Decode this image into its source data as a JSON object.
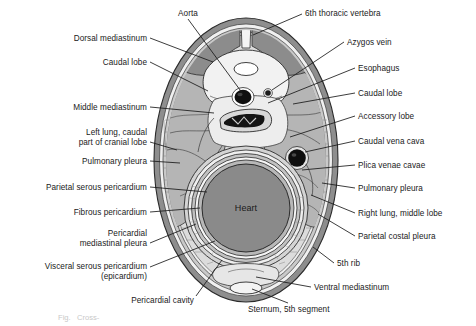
{
  "figure": {
    "center_label": "Heart",
    "faint_caption": "Fig.   Cross-"
  },
  "colors": {
    "outer_wall_dark": "#8e8e8e",
    "wall_light": "#f2f2f2",
    "rib_band": "#c6c6c6",
    "lung": "#b6b6b6",
    "lung_light": "#c8c8c8",
    "mediastinum_light": "#e4e4e4",
    "heart": "#8a8a8a",
    "vertebra_muscle": "#8e8e8e",
    "vessel_black": "#111111",
    "line": "#1a1a1a",
    "text": "#1a1a1a"
  },
  "labels_left": [
    {
      "id": "dorsal-mediastinum",
      "text": "Dorsal mediastinum",
      "x": 14,
      "y": 34,
      "w": 133,
      "align": "right",
      "line": [
        [
          150,
          38
        ],
        [
          213,
          62
        ]
      ]
    },
    {
      "id": "caudal-lobe-left",
      "text": "Caudal lobe",
      "x": 14,
      "y": 58,
      "w": 133,
      "align": "right",
      "line": [
        [
          150,
          62
        ],
        [
          208,
          91
        ]
      ]
    },
    {
      "id": "middle-mediastinum",
      "text": "Middle mediastinum",
      "x": 4,
      "y": 103,
      "w": 143,
      "align": "right",
      "line": [
        [
          150,
          107
        ],
        [
          214,
          113
        ]
      ]
    },
    {
      "id": "left-lung-caudal-cranial",
      "text": "Left lung, caudal\npart of cranial lobe",
      "x": 4,
      "y": 128,
      "w": 143,
      "align": "right",
      "line": [
        [
          150,
          142
        ],
        [
          177,
          150
        ]
      ]
    },
    {
      "id": "pulmonary-pleura-left",
      "text": "Pulmonary pleura",
      "x": 4,
      "y": 157,
      "w": 143,
      "align": "right",
      "line": [
        [
          150,
          161
        ],
        [
          180,
          163
        ]
      ]
    },
    {
      "id": "parietal-serous-pericardium",
      "text": "Parietal serous pericardium",
      "x": 2,
      "y": 183,
      "w": 145,
      "align": "right",
      "line": [
        [
          150,
          187
        ],
        [
          207,
          192
        ]
      ]
    },
    {
      "id": "fibrous-pericardium",
      "text": "Fibrous pericardium",
      "x": 6,
      "y": 208,
      "w": 141,
      "align": "right",
      "line": [
        [
          150,
          212
        ],
        [
          200,
          208
        ]
      ]
    },
    {
      "id": "pericardial-mediastinal-pleura",
      "text": "Pericardial\nmediastinal pleura",
      "x": 6,
      "y": 229,
      "w": 141,
      "align": "right",
      "line": [
        [
          150,
          243
        ],
        [
          196,
          224
        ]
      ]
    },
    {
      "id": "visceral-serous-pericardium",
      "text": "Visceral serous pericardium\n(epicardium)",
      "x": 2,
      "y": 262,
      "w": 145,
      "align": "right",
      "line": [
        [
          150,
          267
        ],
        [
          215,
          241
        ]
      ]
    },
    {
      "id": "pericardial-cavity",
      "text": "Pericardial cavity",
      "x": 104,
      "y": 296,
      "w": 90,
      "align": "right",
      "line": [
        [
          196,
          296
        ],
        [
          222,
          260
        ]
      ]
    }
  ],
  "labels_right": [
    {
      "id": "6th-thoracic-vertebra",
      "text": "6th thoracic vertebra",
      "x": 305,
      "y": 9,
      "w": 160,
      "align": "left",
      "line": [
        [
          302,
          14
        ],
        [
          253,
          35
        ]
      ]
    },
    {
      "id": "azygos-vein",
      "text": "Azygos vein",
      "x": 347,
      "y": 38,
      "w": 125,
      "align": "left",
      "line": [
        [
          344,
          42
        ],
        [
          272,
          90
        ]
      ]
    },
    {
      "id": "esophagus",
      "text": "Esophagus",
      "x": 358,
      "y": 64,
      "w": 114,
      "align": "left",
      "line": [
        [
          355,
          68
        ],
        [
          268,
          103
        ]
      ]
    },
    {
      "id": "caudal-lobe-right",
      "text": "Caudal lobe",
      "x": 358,
      "y": 89,
      "w": 114,
      "align": "left",
      "line": [
        [
          355,
          93
        ],
        [
          293,
          104
        ]
      ]
    },
    {
      "id": "accessory-lobe",
      "text": "Accessory lobe",
      "x": 358,
      "y": 112,
      "w": 114,
      "align": "left",
      "line": [
        [
          355,
          116
        ],
        [
          290,
          137
        ]
      ]
    },
    {
      "id": "caudal-vena-cava",
      "text": "Caudal vena cava",
      "x": 358,
      "y": 137,
      "w": 114,
      "align": "left",
      "line": [
        [
          355,
          141
        ],
        [
          305,
          152
        ]
      ]
    },
    {
      "id": "plica-venae-cavae",
      "text": "Plica venae cavae",
      "x": 358,
      "y": 161,
      "w": 114,
      "align": "left",
      "line": [
        [
          355,
          165
        ],
        [
          302,
          170
        ]
      ]
    },
    {
      "id": "pulmonary-pleura-right",
      "text": "Pulmonary pleura",
      "x": 358,
      "y": 184,
      "w": 114,
      "align": "left",
      "line": [
        [
          355,
          188
        ],
        [
          322,
          183
        ]
      ]
    },
    {
      "id": "right-lung-middle-lobe",
      "text": "Right lung, middle lobe",
      "x": 358,
      "y": 209,
      "w": 118,
      "align": "left",
      "line": [
        [
          355,
          213
        ],
        [
          311,
          195
        ]
      ]
    },
    {
      "id": "parietal-costal-pleura",
      "text": "Parietal costal pleura",
      "x": 358,
      "y": 232,
      "w": 116,
      "align": "left",
      "line": [
        [
          355,
          236
        ],
        [
          318,
          214
        ]
      ]
    },
    {
      "id": "5th-rib",
      "text": "5th rib",
      "x": 337,
      "y": 259,
      "w": 70,
      "align": "left",
      "line": [
        [
          334,
          263
        ],
        [
          313,
          247
        ]
      ]
    },
    {
      "id": "ventral-mediastinum",
      "text": "Ventral mediastinum",
      "x": 314,
      "y": 283,
      "w": 130,
      "align": "left",
      "line": [
        [
          311,
          287
        ],
        [
          256,
          277
        ]
      ]
    },
    {
      "id": "sternum-5th-segment",
      "text": "Sternum, 5th segment",
      "x": 248,
      "y": 305,
      "w": 132,
      "align": "left",
      "line": [
        [
          288,
          303
        ],
        [
          252,
          289
        ]
      ]
    }
  ],
  "labels_top": [
    {
      "id": "aorta",
      "text": "Aorta",
      "x": 158,
      "y": 9,
      "w": 60,
      "align": "center",
      "line": [
        [
          188,
          19
        ],
        [
          243,
          94
        ]
      ]
    }
  ],
  "structures": [
    {
      "id": "thoracic-wall",
      "label": "Thoracic wall"
    },
    {
      "id": "vertebral-body",
      "label": "6th thoracic vertebra"
    },
    {
      "id": "spinal-canal",
      "label": "Vertebral canal"
    },
    {
      "id": "aorta-vessel",
      "label": "Aorta"
    },
    {
      "id": "esophagus-lumen",
      "label": "Esophagus"
    },
    {
      "id": "azygos-vessel",
      "label": "Azygos vein"
    },
    {
      "id": "caudal-vena-cava-vessel",
      "label": "Caudal vena cava"
    },
    {
      "id": "left-lung",
      "label": "Left lung"
    },
    {
      "id": "right-lung",
      "label": "Right lung"
    },
    {
      "id": "heart-mass",
      "label": "Heart"
    },
    {
      "id": "pericardial-sac",
      "label": "Pericardium"
    },
    {
      "id": "sternum",
      "label": "Sternum"
    }
  ]
}
